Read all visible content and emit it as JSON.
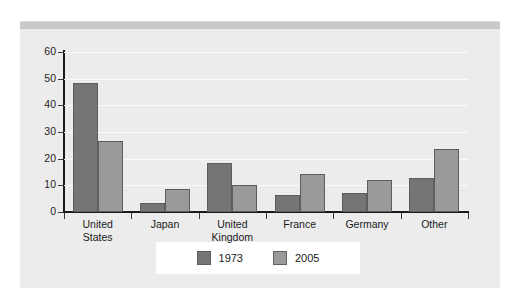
{
  "chart_data": {
    "type": "bar",
    "title": "",
    "subtitle": "",
    "xlabel": "",
    "ylabel": "",
    "categories": [
      "United States",
      "Japan",
      "United Kingdom",
      "France",
      "Germany",
      "Other"
    ],
    "category_lines": [
      [
        "United",
        "States"
      ],
      [
        "Japan"
      ],
      [
        "United",
        "Kingdom"
      ],
      [
        "France"
      ],
      [
        "Germany"
      ],
      [
        "Other"
      ]
    ],
    "series": [
      {
        "name": "1973",
        "color": "#757575",
        "values": [
          48.5,
          3.3,
          18.5,
          6.5,
          7.3,
          12.8
        ]
      },
      {
        "name": "2005",
        "color": "#9a9a9a",
        "values": [
          26.5,
          8.5,
          10.3,
          14.2,
          12.0,
          23.8
        ]
      }
    ],
    "ylim": [
      0,
      60
    ],
    "yticks": [
      0,
      10,
      20,
      30,
      40,
      50,
      60
    ],
    "ytick_labels": [
      "0",
      "10",
      "20",
      "30",
      "40",
      "50",
      "60"
    ],
    "grid": true,
    "grid_axis": "y",
    "legend_position": "bottom",
    "legend_entries": [
      "1973",
      "2005"
    ],
    "plot_background": "#ececec",
    "gridline_color": "#fbfbfb",
    "axis_color": "#1a1a1a"
  },
  "legend": {
    "items": [
      {
        "label": "1973"
      },
      {
        "label": "2005"
      }
    ]
  }
}
